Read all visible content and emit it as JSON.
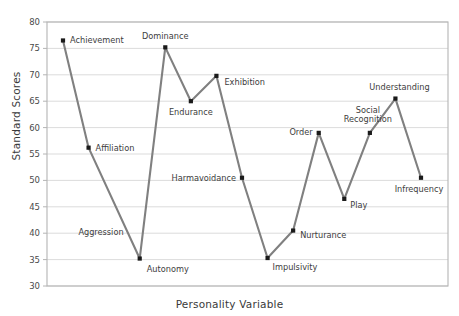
{
  "chart_data": {
    "type": "line",
    "title": "",
    "xlabel": "Personality Variable",
    "ylabel": "Standard Scores",
    "ylim": [
      30,
      80
    ],
    "yticks": [
      30,
      35,
      40,
      45,
      50,
      55,
      60,
      65,
      70,
      75,
      80
    ],
    "grid": true,
    "legend": null,
    "marker": "filled-square",
    "line_color": "#808080",
    "marker_color": "#1a1a1a",
    "categories": [
      "Achievement",
      "Affiliation",
      "Aggression",
      "Autonomy",
      "Dominance",
      "Endurance",
      "Exhibition",
      "Harmavoidance",
      "Impulsivity",
      "Nurturance",
      "Order",
      "Play",
      "Social Recognition",
      "Understanding",
      "Infrequency"
    ],
    "values": [
      76.5,
      56.2,
      null,
      35.2,
      75.2,
      65.0,
      69.8,
      50.5,
      35.3,
      40.5,
      59.0,
      46.5,
      59.0,
      65.5,
      50.5
    ],
    "point_labels": [
      {
        "name": "Achievement",
        "value": 76.5,
        "anchor": "start"
      },
      {
        "name": "Affiliation",
        "value": 56.2,
        "anchor": "start"
      },
      {
        "name": "Aggression",
        "value": null,
        "anchor": "middle"
      },
      {
        "name": "Autonomy",
        "value": 35.2,
        "anchor": "start"
      },
      {
        "name": "Dominance",
        "value": 75.2,
        "anchor": "middle"
      },
      {
        "name": "Endurance",
        "value": 65.0,
        "anchor": "middle"
      },
      {
        "name": "Exhibition",
        "value": 69.8,
        "anchor": "start"
      },
      {
        "name": "Harmavoidance",
        "value": 50.5,
        "anchor": "end"
      },
      {
        "name": "Impulsivity",
        "value": 35.3,
        "anchor": "start"
      },
      {
        "name": "Nurturance",
        "value": 40.5,
        "anchor": "start"
      },
      {
        "name": "Order",
        "value": 59.0,
        "anchor": "end"
      },
      {
        "name": "Play",
        "value": 46.5,
        "anchor": "start"
      },
      {
        "name": "Social Recognition",
        "value": 59.0,
        "anchor": "middle"
      },
      {
        "name": "Understanding",
        "value": 65.5,
        "anchor": "middle"
      },
      {
        "name": "Infrequency",
        "value": 50.5,
        "anchor": "middle"
      }
    ]
  },
  "axis": {
    "ylabel": "Standard Scores",
    "xlabel": "Personality Variable",
    "ytick_0": "30",
    "ytick_1": "35",
    "ytick_2": "40",
    "ytick_3": "45",
    "ytick_4": "50",
    "ytick_5": "55",
    "ytick_6": "60",
    "ytick_7": "65",
    "ytick_8": "70",
    "ytick_9": "75",
    "ytick_10": "80"
  },
  "labels": {
    "achievement": "Achievement",
    "affiliation": "Affiliation",
    "aggression": "Aggression",
    "autonomy": "Autonomy",
    "dominance": "Dominance",
    "endurance": "Endurance",
    "exhibition": "Exhibition",
    "harmavoidance": "Harmavoidance",
    "impulsivity": "Impulsivity",
    "nurturance": "Nurturance",
    "order": "Order",
    "play": "Play",
    "social_recognition_line1": "Social",
    "social_recognition_line2": "Recognition",
    "understanding": "Understanding",
    "infrequency": "Infrequency"
  },
  "colors": {
    "line": "#808080",
    "marker": "#1a1a1a",
    "grid": "#d2d2d2",
    "frame": "#b4b4b4",
    "text": "#3d3d3d",
    "background": "#ffffff"
  }
}
